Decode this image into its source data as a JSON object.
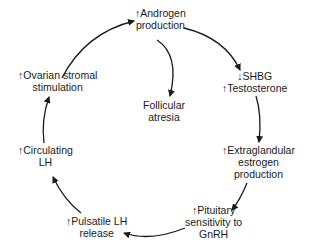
{
  "diagram": {
    "type": "cycle",
    "nodes": [
      {
        "id": "androgen",
        "lines": [
          "↑Androgen",
          "production"
        ]
      },
      {
        "id": "shbg",
        "lines": [
          "↓SHBG",
          "↑Testosterone"
        ]
      },
      {
        "id": "extraglandular",
        "lines": [
          "↑Extraglandular",
          "estrogen",
          "production"
        ]
      },
      {
        "id": "pituitary",
        "lines": [
          "↑Pituitary",
          "sensitivity to",
          "GnRH"
        ]
      },
      {
        "id": "pulsatile",
        "lines": [
          "↑Pulsatile LH",
          "release"
        ]
      },
      {
        "id": "circulating",
        "lines": [
          "↑Circulating",
          "LH"
        ]
      },
      {
        "id": "ovarian",
        "lines": [
          "↑Ovarian stromal",
          "stimulation"
        ]
      },
      {
        "id": "follicular",
        "lines": [
          "Follicular",
          "atresia"
        ]
      }
    ],
    "edges": [
      {
        "from": "androgen",
        "to": "shbg"
      },
      {
        "from": "shbg",
        "to": "extraglandular"
      },
      {
        "from": "extraglandular",
        "to": "pituitary"
      },
      {
        "from": "pituitary",
        "to": "pulsatile"
      },
      {
        "from": "pulsatile",
        "to": "circulating"
      },
      {
        "from": "circulating",
        "to": "ovarian"
      },
      {
        "from": "ovarian",
        "to": "androgen"
      },
      {
        "from": "androgen",
        "to": "follicular"
      }
    ],
    "colors": {
      "line": "#1a1a1a",
      "text": "#1a1a1a",
      "background": "#ffffff"
    }
  }
}
